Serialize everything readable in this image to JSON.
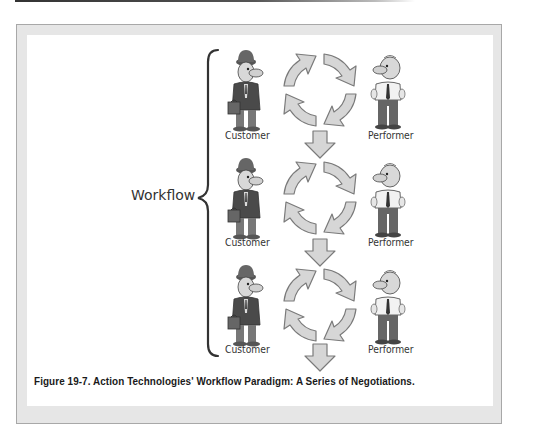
{
  "figure": {
    "title_label": "Workflow",
    "caption": "Figure 19-7.  Action Technologies' Workflow Paradigm: A Series of Negotiations.",
    "rows": [
      {
        "left_role": "Customer",
        "right_role": "Performer",
        "cycle_icon": "negotiation-cycle-icon",
        "next_arrow": "down-arrow-icon"
      },
      {
        "left_role": "Customer",
        "right_role": "Performer",
        "cycle_icon": "negotiation-cycle-icon",
        "next_arrow": "down-arrow-icon"
      },
      {
        "left_role": "Customer",
        "right_role": "Performer",
        "cycle_icon": "negotiation-cycle-icon",
        "next_arrow": "down-arrow-icon"
      }
    ]
  },
  "colors": {
    "frame_fill": "#e6e6e6",
    "frame_border": "#a8a8a8",
    "arrow_fill": "#d4d4d4",
    "arrow_stroke": "#7a7a7a",
    "brace": "#333333"
  }
}
